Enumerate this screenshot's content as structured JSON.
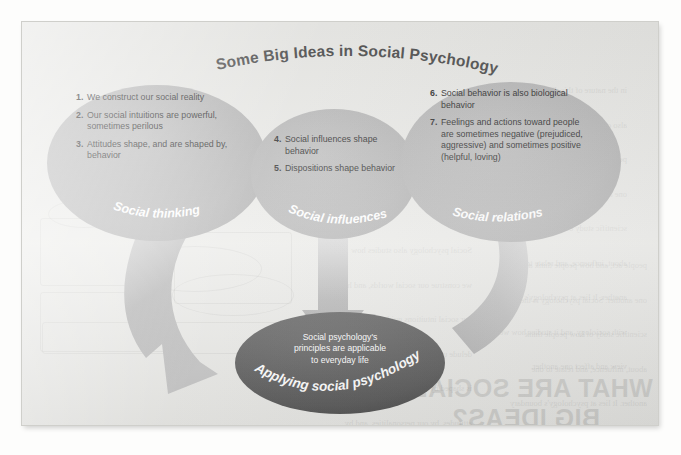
{
  "figure": {
    "title": "Some Big Ideas in Social Psychology",
    "title_color": "#4a4a4a",
    "oval_fill": "#b4b4b4",
    "dark_oval_fill": "#575757",
    "arrow_fill": "#b9b9b9",
    "page_bg": "#e9e9e6"
  },
  "ovals": [
    {
      "id": "social-thinking",
      "label": "Social thinking",
      "items": [
        {
          "num": "1.",
          "text": "We construct our social reality"
        },
        {
          "num": "2.",
          "text": "Our social intuitions are powerful, sometimes perilous"
        },
        {
          "num": "3.",
          "text": "Attitudes shape, and are shaped by, behavior"
        }
      ]
    },
    {
      "id": "social-influences",
      "label": "Social influences",
      "items": [
        {
          "num": "4.",
          "text": "Social influences shape behavior"
        },
        {
          "num": "5.",
          "text": "Dispositions shape behavior"
        }
      ]
    },
    {
      "id": "social-relations",
      "label": "Social relations",
      "items": [
        {
          "num": "6.",
          "text": "Social behavior is also biological behavior"
        },
        {
          "num": "7.",
          "text": "Feelings and actions toward people are sometimes negative (prejudiced, aggressive) and sometimes positive (helpful, loving)"
        }
      ]
    }
  ],
  "conclusion": {
    "id": "applying-social-psychology",
    "label": "Applying social psychology",
    "line1": "Social psychology's",
    "line2": "principles are applicable",
    "line3": "to everyday life"
  },
  "arrows": [
    {
      "id": "arrow-left-curve",
      "from": "social-thinking",
      "to": "applying-social-psychology"
    },
    {
      "id": "arrow-center-down",
      "from": "social-influences",
      "to": "applying-social-psychology"
    },
    {
      "id": "arrow-right-curve",
      "from": "social-relations",
      "to": "applying-social-psychology"
    }
  ],
  "bleed_through": {
    "heading_line1": "WHAT ARE SOCIAL",
    "heading_line2": "BIG IDEAS?",
    "body": [
      "in the nature of this discipline we must",
      "also consider the social situation in which",
      "people act, and how people think about",
      "one another. Social psychology is the",
      "scientific study of how people think",
      "about, influence, and relate to one",
      "another. It lies at psychology's boundary",
      "with sociology, and it studies how we",
      "view and affect one another.",
      "Social psychology also studies how",
      "we construe our social worlds, and how",
      "our social intuitions guide and sometimes",
      "delude us. It considers how our behavior",
      "is shaped by other people, by our",
      "attitudes, by our personalities, and by",
      "biology. And it explores the ways in which",
      "we connect — helping, hurting, loving,",
      "and hating one another."
    ]
  }
}
